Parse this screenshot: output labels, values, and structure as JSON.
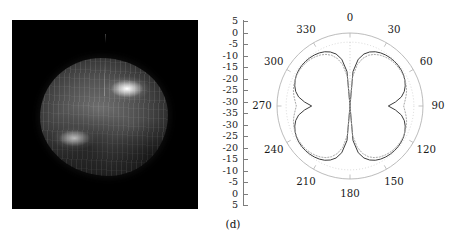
{
  "figure": {
    "caption": "(d)",
    "panels": [
      "3d-surface-pattern",
      "polar-pattern"
    ]
  },
  "surface_panel": {
    "background_color": "#000000",
    "colormap": "grayscale",
    "description_hidden": ""
  },
  "chart_data": [
    {
      "type": "heatmap",
      "title": "",
      "subtitle": "",
      "xlabel": "",
      "ylabel": "",
      "legend": [],
      "background": "#000000",
      "colormap": "gray",
      "note": "3D radiation pattern surface; two bright lobes on upper-right and lower-left of a rounded quasi-spherical body"
    },
    {
      "type": "line",
      "polar": true,
      "title": "",
      "xlabel": "",
      "ylabel": "",
      "grid": true,
      "legend": [],
      "angle_unit": "degrees",
      "angle_ticks": [
        0,
        30,
        60,
        90,
        120,
        150,
        180,
        210,
        240,
        270,
        300,
        330
      ],
      "angle_direction": "clockwise",
      "angle_zero_at": "top",
      "radial_label_unit": "dB",
      "radial_labels_top": [
        "5",
        "0",
        "-5",
        "-10",
        "-15",
        "-20",
        "-25",
        "-30",
        "-35"
      ],
      "radial_labels_bottom": [
        "-30",
        "-25",
        "-20",
        "-15",
        "-10",
        "-5",
        "0",
        "5"
      ],
      "rlim": [
        -35,
        5
      ],
      "series": [
        {
          "name": "measured",
          "style": "solid",
          "color": "#3c3c3c",
          "theta": [
            0,
            5,
            10,
            15,
            20,
            25,
            30,
            35,
            40,
            45,
            50,
            55,
            60,
            65,
            70,
            75,
            80,
            85,
            90,
            95,
            100,
            105,
            110,
            115,
            120,
            125,
            130,
            135,
            140,
            145,
            150,
            155,
            160,
            165,
            170,
            175,
            180,
            185,
            190,
            195,
            200,
            205,
            210,
            215,
            220,
            225,
            230,
            235,
            240,
            245,
            250,
            255,
            260,
            265,
            270,
            275,
            280,
            285,
            290,
            295,
            300,
            305,
            310,
            315,
            320,
            325,
            330,
            335,
            340,
            345,
            350,
            355,
            360
          ],
          "r": [
            -35,
            -16,
            -9,
            -5.5,
            -3.5,
            -2.2,
            -1.4,
            -0.9,
            -0.6,
            -0.5,
            -0.5,
            -0.7,
            -1.1,
            -1.8,
            -2.8,
            -4.2,
            -6.4,
            -10,
            -14,
            -10,
            -6.4,
            -4.2,
            -2.8,
            -1.8,
            -1.1,
            -0.7,
            -0.5,
            -0.5,
            -0.6,
            -0.9,
            -1.4,
            -2.2,
            -3.5,
            -5.5,
            -9,
            -16,
            -35,
            -16,
            -9,
            -5.5,
            -3.5,
            -2.2,
            -1.4,
            -0.9,
            -0.6,
            -0.5,
            -0.5,
            -0.7,
            -1.1,
            -1.8,
            -2.8,
            -4.2,
            -6.4,
            -10,
            -14,
            -10,
            -6.4,
            -4.2,
            -2.8,
            -1.8,
            -1.1,
            -0.7,
            -0.5,
            -0.5,
            -0.6,
            -0.9,
            -1.4,
            -2.2,
            -3.5,
            -5.5,
            -9,
            -16,
            -35
          ]
        },
        {
          "name": "reference",
          "style": "dotted",
          "color": "#a8a8a8",
          "theta": [
            0,
            5,
            10,
            15,
            20,
            25,
            30,
            35,
            40,
            45,
            50,
            55,
            60,
            65,
            70,
            75,
            80,
            85,
            90,
            95,
            100,
            105,
            110,
            115,
            120,
            125,
            130,
            135,
            140,
            145,
            150,
            155,
            160,
            165,
            170,
            175,
            180,
            185,
            190,
            195,
            200,
            205,
            210,
            215,
            220,
            225,
            230,
            235,
            240,
            245,
            250,
            255,
            260,
            265,
            270,
            275,
            280,
            285,
            290,
            295,
            300,
            305,
            310,
            315,
            320,
            325,
            330,
            335,
            340,
            345,
            350,
            355,
            360
          ],
          "r": [
            -35,
            -19,
            -12,
            -8,
            -5.4,
            -3.8,
            -2.7,
            -2.0,
            -1.5,
            -1.2,
            -1.1,
            -1.1,
            -1.3,
            -1.7,
            -2.2,
            -2.9,
            -3.8,
            -4.8,
            -5.6,
            -4.8,
            -3.8,
            -2.9,
            -2.2,
            -1.7,
            -1.3,
            -1.1,
            -1.1,
            -1.2,
            -1.5,
            -2.0,
            -2.7,
            -3.8,
            -5.4,
            -8,
            -12,
            -19,
            -35,
            -19,
            -12,
            -8,
            -5.4,
            -3.8,
            -2.7,
            -2.0,
            -1.5,
            -1.2,
            -1.1,
            -1.1,
            -1.3,
            -1.7,
            -2.2,
            -2.9,
            -3.8,
            -4.8,
            -5.6,
            -4.8,
            -3.8,
            -2.9,
            -2.2,
            -1.7,
            -1.3,
            -1.1,
            -1.1,
            -1.2,
            -1.5,
            -2.0,
            -2.7,
            -3.8,
            -5.4,
            -8,
            -12,
            -19,
            -35
          ]
        }
      ]
    }
  ],
  "radial_axis": {
    "ticks": [
      "5",
      "0",
      "-5",
      "-10",
      "-15",
      "-20",
      "-25",
      "-30",
      "-35",
      "-30",
      "-25",
      "-20",
      "-15",
      "-10",
      "-5",
      "0",
      "5"
    ]
  },
  "polar_axis": {
    "angles": [
      "0",
      "30",
      "60",
      "90",
      "120",
      "150",
      "180",
      "210",
      "240",
      "270",
      "300",
      "330"
    ]
  },
  "colors": {
    "curve_main": "#3c3c3c",
    "curve_reference": "#a8a8a8",
    "grid": "#b4b4b4",
    "axis": "#7d7d7d",
    "text": "#1a1a1a",
    "panel_background": "#000000"
  }
}
